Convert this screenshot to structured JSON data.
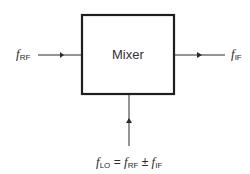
{
  "diagram": {
    "block": {
      "label": "Mixer"
    },
    "input": {
      "symbol": "f",
      "subscript": "RF"
    },
    "output": {
      "symbol": "f",
      "subscript": "IF"
    },
    "lo": {
      "lhs_symbol": "f",
      "lhs_sub": "LO",
      "equals": "=",
      "t1_symbol": "f",
      "t1_sub": "RF",
      "op": "±",
      "t2_symbol": "f",
      "t2_sub": "IF"
    },
    "colors": {
      "line": "#2a2a2a",
      "box_border": "#1e1e1e",
      "background": "#ffffff"
    }
  }
}
